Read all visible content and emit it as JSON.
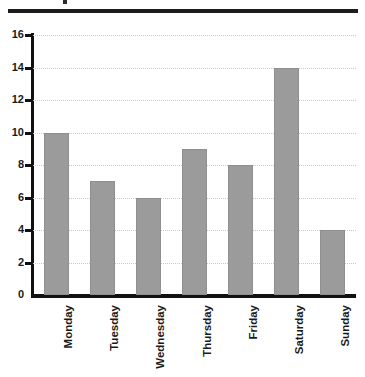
{
  "chart_data": {
    "type": "bar",
    "title": "",
    "xlabel": "",
    "ylabel": "",
    "categories": [
      "Monday",
      "Tuesday",
      "Wednesday",
      "Thursday",
      "Friday",
      "Saturday",
      "Sunday"
    ],
    "values": [
      10,
      7,
      6,
      9,
      8,
      14,
      4
    ],
    "ylim": [
      0,
      16
    ],
    "ytick_values": [
      0,
      2,
      4,
      6,
      8,
      10,
      12,
      14,
      16
    ],
    "ytick_labels": [
      "0",
      "2",
      "4",
      "6",
      "8",
      "10",
      "12",
      "14",
      "16"
    ],
    "grid": true,
    "grid_style": "dotted",
    "grid_color": "#c9c9cf",
    "legend": null,
    "bar_color": "#9b9b9b",
    "bar_edge_color": "#8f8f8f",
    "axis_color": "#111111",
    "xlabel_rotation": 90
  },
  "decoration": {
    "top_rule": "horizontal-rule",
    "top_mark": "clipped-glyph-descender"
  }
}
